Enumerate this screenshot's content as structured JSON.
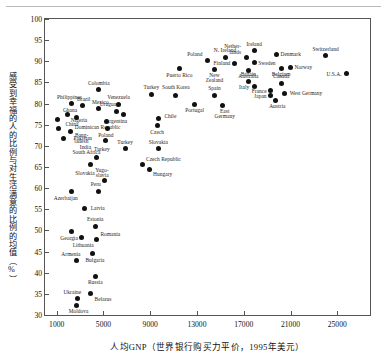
{
  "chart_data": {
    "type": "scatter",
    "title": "",
    "xlabel": "人均GNP（世界银行购买力平价，1995年美元）",
    "ylabel": "感受到幸福的人的比例与对生活满意的比例的均值（%）",
    "xlim": [
      0,
      27800
    ],
    "ylim": [
      30,
      100
    ],
    "xticks": [
      1000,
      5000,
      9000,
      13000,
      17000,
      21000,
      25000
    ],
    "xtick_labels": [
      "1000",
      "5000",
      "9000",
      "13000",
      "17000",
      "21000",
      "25000"
    ],
    "yticks": [
      30,
      35,
      40,
      45,
      50,
      55,
      60,
      65,
      70,
      75,
      80,
      85,
      90,
      95,
      100
    ],
    "ytick_labels": [
      "30",
      "35",
      "40",
      "45",
      "50",
      "55",
      "60",
      "65",
      "70",
      "75",
      "80",
      "85",
      "90",
      "95",
      "100"
    ],
    "grid": false,
    "legend": "none",
    "marker_color": "#111111",
    "points": [
      {
        "label": "Nigeria",
        "x": 1050,
        "y": 76.3,
        "lx": 30,
        "ly": 2,
        "align": "r"
      },
      {
        "label": "Bang-\nladesh",
        "x": 1150,
        "y": 74.2,
        "lx": 30,
        "ly": 8,
        "align": "r"
      },
      {
        "label": "India",
        "x": 1550,
        "y": 71.7,
        "lx": 28,
        "ly": 9,
        "align": "r"
      },
      {
        "label": "Ghana",
        "x": 1900,
        "y": 77.3,
        "lx": 10,
        "ly": -4,
        "align": "r"
      },
      {
        "label": "Philippines",
        "x": 2300,
        "y": 80.0,
        "lx": 10,
        "ly": -6,
        "align": "r"
      },
      {
        "label": "Pakistan",
        "x": 2150,
        "y": 73.5,
        "lx": 22,
        "ly": 8,
        "align": "r"
      },
      {
        "label": "China",
        "x": 2700,
        "y": 76.8,
        "lx": 2,
        "ly": 8,
        "align": "r"
      },
      {
        "label": "Brazil",
        "x": 3200,
        "y": 79.5,
        "lx": 8,
        "ly": -6,
        "align": "r"
      },
      {
        "label": "Colombia",
        "x": 4600,
        "y": 83.3,
        "lx": 0,
        "ly": -6,
        "align": "c"
      },
      {
        "label": "Mexico",
        "x": 4600,
        "y": 78.8,
        "lx": 10,
        "ly": -6,
        "align": "r"
      },
      {
        "label": "Uruguay",
        "x": 6150,
        "y": 78.2,
        "lx": 2,
        "ly": -6,
        "align": "r"
      },
      {
        "label": "Venezuela",
        "x": 6300,
        "y": 79.8,
        "lx": 0,
        "ly": -6,
        "align": "c"
      },
      {
        "label": "Argentina",
        "x": 6700,
        "y": 77.3,
        "lx": 4,
        "ly": 7,
        "align": "r"
      },
      {
        "label": "Dominican Republic",
        "x": 5250,
        "y": 75.7,
        "lx": 14,
        "ly": 6,
        "align": "r"
      },
      {
        "label": "Poland",
        "x": 5350,
        "y": 74.0,
        "lx": 6,
        "ly": 7,
        "align": "r"
      },
      {
        "label": "Turkey",
        "x": 5200,
        "y": 71.2,
        "lx": 4,
        "ly": 9,
        "align": "r"
      },
      {
        "label": "South Africa",
        "x": 4400,
        "y": 67.2,
        "lx": 4,
        "ly": -5,
        "align": "r"
      },
      {
        "label": "Slovakia",
        "x": 3900,
        "y": 65.5,
        "lx": 4,
        "ly": 9,
        "align": "r"
      },
      {
        "label": "Yugo-\nslavia",
        "x": 5100,
        "y": 61.8,
        "lx": 4,
        "ly": -10,
        "align": "r"
      },
      {
        "label": "Czech Republic",
        "x": 8300,
        "y": 65.5,
        "lx": 4,
        "ly": -5,
        "align": "l"
      },
      {
        "label": "Hungary",
        "x": 8900,
        "y": 64.5,
        "lx": 4,
        "ly": 6,
        "align": "l"
      },
      {
        "label": "Slovakia",
        "x": 9700,
        "y": 69.3,
        "lx": 0,
        "ly": -6,
        "align": "c"
      },
      {
        "label": "Turkey",
        "x": 6850,
        "y": 69.3,
        "lx": 0,
        "ly": -6,
        "align": "c"
      },
      {
        "label": "Czech",
        "x": 9600,
        "y": 74.8,
        "lx": 0,
        "ly": 7,
        "align": "c"
      },
      {
        "label": "Chile",
        "x": 9700,
        "y": 76.5,
        "lx": 6,
        "ly": -1,
        "align": "l"
      },
      {
        "label": "Turkey",
        "x": 9100,
        "y": 82.2,
        "lx": 0,
        "ly": -6,
        "align": "c"
      },
      {
        "label": "South Korea",
        "x": 11200,
        "y": 82.0,
        "lx": 0,
        "ly": -7,
        "align": "c"
      },
      {
        "label": "Puerto Rico",
        "x": 11500,
        "y": 88.2,
        "lx": 0,
        "ly": 7,
        "align": "c"
      },
      {
        "label": "Peru",
        "x": 4600,
        "y": 59.3,
        "lx": 2,
        "ly": -6,
        "align": "r"
      },
      {
        "label": "Azerbaijan",
        "x": 2300,
        "y": 59.3,
        "lx": 6,
        "ly": 8,
        "align": "r"
      },
      {
        "label": "Latvia",
        "x": 3400,
        "y": 55.3,
        "lx": 6,
        "ly": 1,
        "align": "l"
      },
      {
        "label": "Estonia",
        "x": 4300,
        "y": 51.0,
        "lx": 0,
        "ly": -6,
        "align": "c"
      },
      {
        "label": "Romania",
        "x": 4400,
        "y": 47.8,
        "lx": 4,
        "ly": -5,
        "align": "l"
      },
      {
        "label": "Georgia",
        "x": 2300,
        "y": 49.8,
        "lx": 6,
        "ly": 8,
        "align": "r"
      },
      {
        "label": "Lithuania",
        "x": 3100,
        "y": 48.3,
        "lx": 2,
        "ly": 8,
        "align": "c"
      },
      {
        "label": "Armenia",
        "x": 2700,
        "y": 43.0,
        "lx": 4,
        "ly": -5,
        "align": "r"
      },
      {
        "label": "Bulgaria",
        "x": 4100,
        "y": 44.5,
        "lx": 2,
        "ly": 7,
        "align": "c"
      },
      {
        "label": "Russia",
        "x": 4300,
        "y": 39.2,
        "lx": 0,
        "ly": 7,
        "align": "c"
      },
      {
        "label": "Belarus",
        "x": 3900,
        "y": 35.0,
        "lx": 4,
        "ly": 6,
        "align": "l"
      },
      {
        "label": "Ukraine",
        "x": 2750,
        "y": 34.0,
        "lx": 4,
        "ly": -5,
        "align": "r"
      },
      {
        "label": "Moldova",
        "x": 2700,
        "y": 32.2,
        "lx": 2,
        "ly": 6,
        "align": "c"
      },
      {
        "label": "Portugal",
        "x": 12800,
        "y": 79.8,
        "lx": 0,
        "ly": 7,
        "align": "c"
      },
      {
        "label": "Spain",
        "x": 14500,
        "y": 82.0,
        "lx": 0,
        "ly": -6,
        "align": "c"
      },
      {
        "label": "East\nGermany",
        "x": 15200,
        "y": 79.5,
        "lx": 2,
        "ly": 6,
        "align": "c"
      },
      {
        "label": "Poland",
        "x": 13900,
        "y": 90.2,
        "lx": -5,
        "ly": -5,
        "align": "r"
      },
      {
        "label": "N. Ireland",
        "x": 15400,
        "y": 91.0,
        "lx": 0,
        "ly": -6,
        "align": "c"
      },
      {
        "label": "New\nZealand",
        "x": 14500,
        "y": 88.0,
        "lx": 0,
        "ly": 6,
        "align": "c"
      },
      {
        "label": "Finland",
        "x": 16200,
        "y": 89.5,
        "lx": -4,
        "ly": 1,
        "align": "r"
      },
      {
        "label": "Nether-\nlands",
        "x": 17200,
        "y": 91.0,
        "lx": -5,
        "ly": -10,
        "align": "r"
      },
      {
        "label": "Sweden",
        "x": 17900,
        "y": 89.8,
        "lx": 4,
        "ly": 2,
        "align": "l"
      },
      {
        "label": "Ireland",
        "x": 17900,
        "y": 92.5,
        "lx": 0,
        "ly": -6,
        "align": "c"
      },
      {
        "label": "Denmark",
        "x": 19800,
        "y": 91.5,
        "lx": 4,
        "ly": 0,
        "align": "l"
      },
      {
        "label": "Switzerland",
        "x": 24000,
        "y": 91.3,
        "lx": 0,
        "ly": -6,
        "align": "c"
      },
      {
        "label": "Norway",
        "x": 21000,
        "y": 88.5,
        "lx": 4,
        "ly": 0,
        "align": "l"
      },
      {
        "label": "U.S.A.",
        "x": 25800,
        "y": 87.0,
        "lx": -5,
        "ly": 1,
        "align": "r"
      },
      {
        "label": "Australia",
        "x": 17400,
        "y": 87.8,
        "lx": 0,
        "ly": 6,
        "align": "c"
      },
      {
        "label": "Belgium",
        "x": 20200,
        "y": 88.3,
        "lx": 0,
        "ly": 7,
        "align": "c"
      },
      {
        "label": "Britain",
        "x": 17400,
        "y": 85.3,
        "lx": 0,
        "ly": -6,
        "align": "c"
      },
      {
        "label": "Italy",
        "x": 17900,
        "y": 84.0,
        "lx": -5,
        "ly": 1,
        "align": "r"
      },
      {
        "label": "Canada",
        "x": 20200,
        "y": 84.8,
        "lx": 0,
        "ly": -6,
        "align": "c"
      },
      {
        "label": "France",
        "x": 19300,
        "y": 83.0,
        "lx": -4,
        "ly": 1,
        "align": "r"
      },
      {
        "label": "Japan",
        "x": 19300,
        "y": 81.8,
        "lx": -4,
        "ly": 1,
        "align": "r"
      },
      {
        "label": "West Germany",
        "x": 20500,
        "y": 82.5,
        "lx": 5,
        "ly": 1,
        "align": "l"
      },
      {
        "label": "Austria",
        "x": 19700,
        "y": 80.8,
        "lx": 2,
        "ly": 7,
        "align": "c"
      }
    ]
  }
}
